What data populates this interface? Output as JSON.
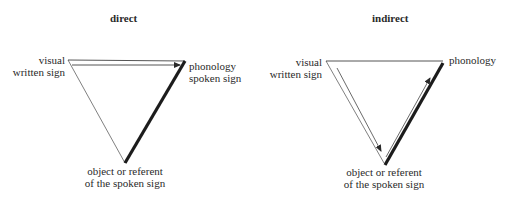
{
  "diagrams": [
    {
      "title": "direct",
      "labels": {
        "top_left": [
          "visual",
          "written sign"
        ],
        "top_right": [
          "phonology",
          "spoken sign"
        ],
        "bottom": [
          "object or referent",
          "of the spoken sign"
        ]
      }
    },
    {
      "title": "indirect",
      "labels": {
        "top_left": [
          "visual",
          "written sign"
        ],
        "top_right": [
          "phonology"
        ],
        "bottom": [
          "object or referent",
          "of the spoken sign"
        ]
      }
    }
  ],
  "colors": {
    "line": "#2a2a2a",
    "background": "#ffffff"
  }
}
